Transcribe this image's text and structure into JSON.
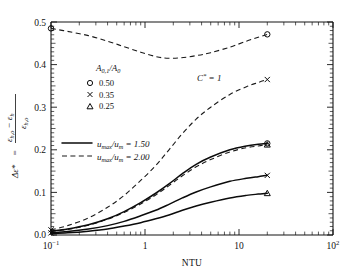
{
  "chart_data": {
    "type": "line",
    "title": "",
    "xlabel": "NTU",
    "ylabel": "Δε* = (εh,o − εh) / εh,o",
    "xscale": "log",
    "xlim": [
      0.1,
      100
    ],
    "ylim": [
      0.0,
      0.5
    ],
    "xtick_labels": [
      "10⁻¹",
      "1",
      "10",
      "10²"
    ],
    "xtick_values": [
      0.1,
      1,
      10,
      100
    ],
    "ytick_labels": [
      "0.0",
      "0.1",
      "0.2",
      "0.3",
      "0.4",
      "0.5"
    ],
    "ytick_values": [
      0.0,
      0.1,
      0.2,
      0.3,
      0.4,
      0.5
    ],
    "grid": false,
    "annotations": [
      {
        "name": "cstar-annotation",
        "text": "C* = 1",
        "x": 1.9,
        "y": 0.355
      }
    ],
    "legend_marker_title": "A0,1/A0",
    "legend_markers": [
      {
        "symbol": "circle",
        "label": "0.50"
      },
      {
        "symbol": "x",
        "label": "0.35"
      },
      {
        "symbol": "triangle",
        "label": "0.25"
      }
    ],
    "legend_lines": [
      {
        "style": "solid",
        "label": "umax/um = 1.50"
      },
      {
        "style": "dashed",
        "label": "umax/um = 2.00"
      }
    ],
    "series": [
      {
        "name": "A0,1/A0 = 0.50, umax/um = 2.00",
        "style": "dashed",
        "marker": "circle",
        "x": [
          0.1,
          0.15,
          0.25,
          0.4,
          0.6,
          0.9,
          1.3,
          1.7,
          2.4,
          3.5,
          5.0,
          8.0,
          12.0,
          16.0,
          20.0
        ],
        "y": [
          0.485,
          0.478,
          0.468,
          0.455,
          0.442,
          0.429,
          0.419,
          0.415,
          0.416,
          0.421,
          0.428,
          0.441,
          0.455,
          0.464,
          0.471
        ]
      },
      {
        "name": "A0,1/A0 = 0.35, umax/um = 2.00",
        "style": "dashed",
        "marker": "x",
        "x": [
          0.1,
          0.15,
          0.25,
          0.4,
          0.6,
          0.9,
          1.3,
          1.8,
          2.5,
          3.5,
          5.0,
          8.0,
          12.0,
          16.0,
          20.0
        ],
        "y": [
          0.012,
          0.022,
          0.04,
          0.065,
          0.093,
          0.128,
          0.163,
          0.2,
          0.238,
          0.272,
          0.3,
          0.33,
          0.348,
          0.358,
          0.365
        ]
      },
      {
        "name": "A0,1/A0 = 0.25, umax/um = 2.00",
        "style": "dashed",
        "marker": "triangle",
        "x": [
          0.1,
          0.15,
          0.25,
          0.4,
          0.6,
          0.9,
          1.3,
          1.8,
          2.5,
          3.5,
          5.0,
          8.0,
          12.0,
          16.0,
          20.0
        ],
        "y": [
          0.008,
          0.013,
          0.023,
          0.037,
          0.053,
          0.073,
          0.094,
          0.116,
          0.139,
          0.16,
          0.177,
          0.195,
          0.205,
          0.209,
          0.212
        ]
      },
      {
        "name": "A0,1/A0 = 0.50, umax/um = 1.50",
        "style": "solid",
        "marker": "circle",
        "x": [
          0.1,
          0.15,
          0.25,
          0.4,
          0.6,
          0.9,
          1.3,
          1.8,
          2.5,
          3.5,
          5.0,
          8.0,
          12.0,
          16.0,
          20.0
        ],
        "y": [
          0.009,
          0.014,
          0.024,
          0.038,
          0.055,
          0.076,
          0.098,
          0.12,
          0.144,
          0.166,
          0.183,
          0.2,
          0.209,
          0.213,
          0.215
        ]
      },
      {
        "name": "A0,1/A0 = 0.35, umax/um = 1.50",
        "style": "solid",
        "marker": "x",
        "x": [
          0.1,
          0.15,
          0.25,
          0.4,
          0.6,
          0.9,
          1.3,
          1.8,
          2.5,
          3.5,
          5.0,
          8.0,
          12.0,
          16.0,
          20.0
        ],
        "y": [
          0.005,
          0.008,
          0.014,
          0.022,
          0.032,
          0.045,
          0.058,
          0.072,
          0.087,
          0.101,
          0.113,
          0.126,
          0.133,
          0.137,
          0.14
        ]
      },
      {
        "name": "A0,1/A0 = 0.25, umax/um = 1.50",
        "style": "solid",
        "marker": "triangle",
        "x": [
          0.1,
          0.15,
          0.25,
          0.4,
          0.6,
          0.9,
          1.3,
          1.8,
          2.5,
          3.5,
          5.0,
          8.0,
          12.0,
          16.0,
          20.0
        ],
        "y": [
          0.003,
          0.005,
          0.009,
          0.014,
          0.021,
          0.029,
          0.038,
          0.047,
          0.058,
          0.068,
          0.077,
          0.087,
          0.093,
          0.096,
          0.098
        ]
      }
    ]
  },
  "axis": {
    "x_label": "NTU",
    "y_label_delta": "Δε*",
    "y_label_eq": "=",
    "y_label_num": "εh,o − εh",
    "y_label_den": "εh,o"
  },
  "labels": {
    "x_tick_0": "10",
    "x_tick_0_sup": "−1",
    "x_tick_1": "1",
    "x_tick_2": "10",
    "x_tick_3": "10",
    "x_tick_3_sup": "2",
    "y_tick_0": "0.0",
    "y_tick_1": "0.1",
    "y_tick_2": "0.2",
    "y_tick_3": "0.3",
    "y_tick_4": "0.4",
    "y_tick_5": "0.5"
  },
  "legend": {
    "area_ratio_title_main": "A",
    "area_ratio_title_sub1": "0,1",
    "area_ratio_title_slash": "/A",
    "area_ratio_title_sub2": "0",
    "item_circle_value": "0.50",
    "item_x_value": "0.35",
    "item_triangle_value": "0.25",
    "solid_label_main": "u",
    "solid_label_sub": "max",
    "solid_label_mid": "/u",
    "solid_label_sub2": "m",
    "solid_label_val": " = 1.50",
    "dashed_label_val": " = 2.00",
    "cstar_main": "C",
    "cstar_star": "*",
    "cstar_val": " = 1"
  }
}
